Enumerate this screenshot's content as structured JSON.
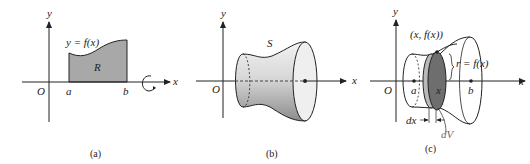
{
  "panels": [
    {
      "id": "a",
      "caption": "(a)",
      "labels": {
        "y_axis": "y",
        "x_axis": "x",
        "origin": "O",
        "a": "a",
        "b": "b",
        "curve": "y = f(x)",
        "region": "R"
      }
    },
    {
      "id": "b",
      "caption": "(b)",
      "labels": {
        "y_axis": "y",
        "origin": "O",
        "solid": "S"
      }
    },
    {
      "id": "c",
      "caption": "(c)",
      "labels": {
        "y_axis": "y",
        "x_axis_left": "x",
        "x_axis": "x",
        "origin": "O",
        "a": "a",
        "b": "b",
        "x_point": "x",
        "point": "(x, f(x))",
        "radius": "r = f(x)",
        "dx": "dx",
        "dV": "dV"
      }
    }
  ],
  "colors": {
    "region_fill": "#a8a8a8",
    "disk_dark": "#6e6e6e",
    "disk_light": "#b9b9b9",
    "line": "#222222"
  }
}
